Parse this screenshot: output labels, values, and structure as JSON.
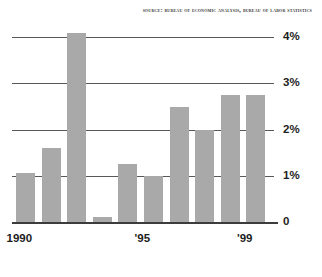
{
  "source_note": "Source: Bureau of Economic Analysis, Bureau of Labor Statistics",
  "colors": {
    "bar_fill": "#a9a9a9",
    "gridline": "#56585a",
    "axis": "#3a3c3e",
    "text": "#1d1d1d",
    "background": "#ffffff"
  },
  "chart_data": {
    "type": "bar",
    "title": "",
    "subtitle": "",
    "xlabel": "",
    "ylabel": "",
    "categories": [
      "1990",
      "1991",
      "1992",
      "1993",
      "1994",
      "1995",
      "1996",
      "1997",
      "1998",
      "1999"
    ],
    "values": [
      1.05,
      1.6,
      4.1,
      0.1,
      1.25,
      1.0,
      2.5,
      2.0,
      2.75,
      2.75
    ],
    "ylim": [
      0,
      4.3
    ],
    "yticks": [
      0,
      1,
      2,
      3,
      4
    ],
    "ytick_labels": [
      "0",
      "1%",
      "2%",
      "3%",
      "4%"
    ],
    "xtick_positions": [
      0,
      5,
      9
    ],
    "xtick_labels": [
      "1990",
      "'95",
      "'99"
    ],
    "grid": true,
    "legend": "none",
    "annotations": [
      "Source: Bureau of Economic Analysis, Bureau of Labor Statistics"
    ]
  }
}
